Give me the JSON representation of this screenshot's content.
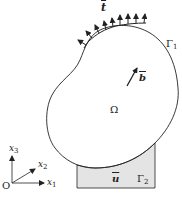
{
  "figure": {
    "labels": {
      "traction": "t",
      "boundary_1_symbol": "Γ",
      "boundary_1_index": "1",
      "body_force": "b",
      "domain": "Ω",
      "displacement": "u",
      "boundary_2_symbol": "Γ",
      "boundary_2_index": "2",
      "origin": "O",
      "axis_x1": "x",
      "axis_x1_index": "1",
      "axis_x2": "x",
      "axis_x2_index": "2",
      "axis_x3": "x",
      "axis_x3_index": "3"
    },
    "traction_arrow_count": 9,
    "colors": {
      "stroke": "#222222",
      "support_fill": "#e4e4e4",
      "background": "#ffffff"
    }
  }
}
